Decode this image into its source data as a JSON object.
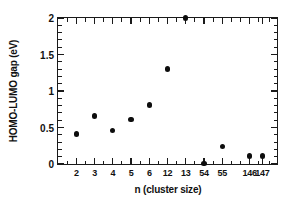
{
  "chart_data": {
    "type": "scatter",
    "title": "",
    "xlabel": "n (cluster size)",
    "ylabel": "HOMO-LUMO gap (eV)",
    "xlim": [
      0,
      12
    ],
    "ylim": [
      0,
      2
    ],
    "grid": false,
    "legend": null,
    "marker": {
      "shape": "filled-circle",
      "color": "#0d0d0d",
      "size_px": 5.4
    },
    "axis": {
      "frame": "box",
      "tick_direction": "in",
      "x_categories": [
        "2",
        "3",
        "4",
        "5",
        "6",
        "12",
        "13",
        "54",
        "55",
        "146",
        "147"
      ],
      "x_tick_labels": [
        "2",
        "3",
        "4",
        "5",
        "6",
        "12",
        "13",
        "54",
        "55",
        "146",
        "147"
      ],
      "x_tick_positions": [
        1,
        2,
        3,
        4,
        5,
        6,
        7,
        8,
        9,
        10.5,
        11.2
      ],
      "x_minor_ticks": [
        0.5,
        1.5,
        2.5,
        3.5,
        4.5,
        5.5,
        6.5,
        7.5,
        8.5,
        9.5,
        10,
        11,
        11.6
      ],
      "y_tick_labels": [
        "0",
        "0.5",
        "1",
        "1.5",
        "2"
      ],
      "y_tick_values": [
        0,
        0.5,
        1,
        1.5,
        2
      ],
      "y_minor_step": 0.1
    },
    "categories": [
      "2",
      "3",
      "4",
      "5",
      "6",
      "12",
      "13",
      "54",
      "55",
      "146",
      "147"
    ],
    "values": [
      0.41,
      0.66,
      0.46,
      0.61,
      0.81,
      1.3,
      2.0,
      0.01,
      0.24,
      0.11,
      0.11
    ],
    "points": [
      {
        "label": "2",
        "x": 1,
        "y": 0.41
      },
      {
        "label": "3",
        "x": 2,
        "y": 0.66
      },
      {
        "label": "4",
        "x": 3,
        "y": 0.46
      },
      {
        "label": "5",
        "x": 4,
        "y": 0.61
      },
      {
        "label": "6",
        "x": 5,
        "y": 0.81
      },
      {
        "label": "12",
        "x": 6,
        "y": 1.3
      },
      {
        "label": "13",
        "x": 7,
        "y": 2.0
      },
      {
        "label": "54",
        "x": 8,
        "y": 0.01
      },
      {
        "label": "55",
        "x": 9,
        "y": 0.24
      },
      {
        "label": "146",
        "x": 10.5,
        "y": 0.11
      },
      {
        "label": "147",
        "x": 11.2,
        "y": 0.11
      }
    ]
  }
}
